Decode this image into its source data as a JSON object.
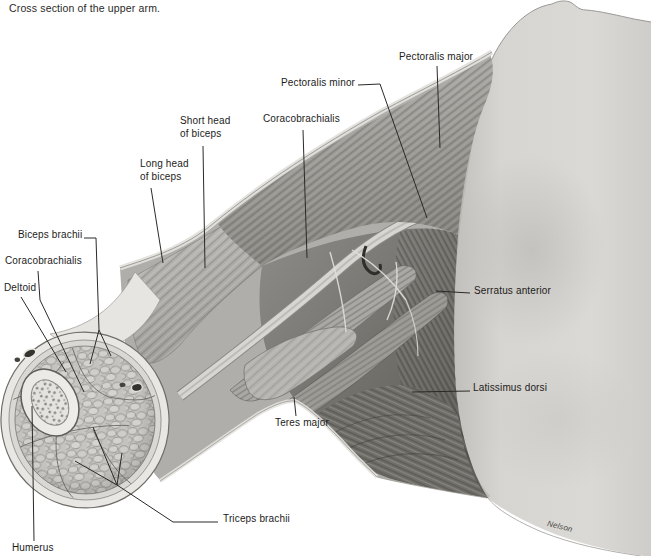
{
  "figure": {
    "caption": "Cross section of the upper arm.",
    "artist_signature": "Nelson",
    "labels": {
      "pectoralis_major": "Pectoralis major",
      "pectoralis_minor": "Pectoralis minor",
      "coracobrachialis_upper": "Coracobrachialis",
      "short_head_line1": "Short head",
      "short_head_line2": "of biceps",
      "long_head_line1": "Long head",
      "long_head_line2": "of biceps",
      "biceps_brachii": "Biceps brachii",
      "coracobrachialis_left": "Coracobrachialis",
      "deltoid": "Deltoid",
      "serratus_anterior": "Serratus anterior",
      "latissimus_dorsi": "Latissimus dorsi",
      "teres_major": "Teres major",
      "triceps_brachii": "Triceps brachii",
      "humerus": "Humerus"
    },
    "colors": {
      "paper": "#ffffff",
      "ink": "#2b2a28",
      "skin_light": "#d9d7d3",
      "muscle_mid": "#a8a6a2",
      "muscle_dark": "#605e5a"
    }
  }
}
